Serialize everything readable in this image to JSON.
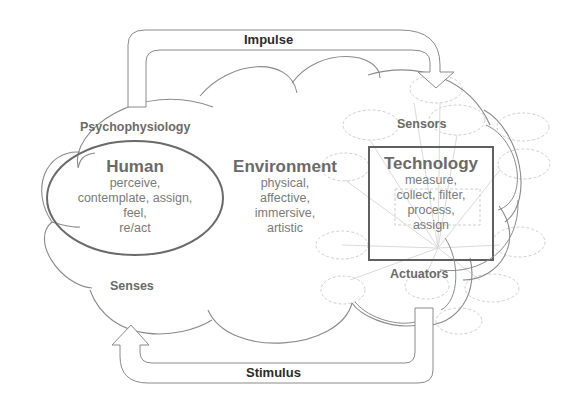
{
  "diagram": {
    "arrows": {
      "impulse": "Impulse",
      "stimulus": "Stimulus"
    },
    "human": {
      "title": "Human",
      "lines": [
        "perceive,",
        "contemplate, assign,",
        "feel,",
        "re/act"
      ],
      "top_label": "Psychophysiology",
      "bottom_label": "Senses"
    },
    "environment": {
      "title": "Environment",
      "lines": [
        "physical,",
        "affective,",
        "immersive,",
        "artistic"
      ]
    },
    "technology": {
      "title": "Technology",
      "lines": [
        "measure,",
        "collect, filter,",
        "process,",
        "assign"
      ],
      "top_label": "Sensors",
      "bottom_label": "Actuators"
    },
    "colors": {
      "line": "#8a8a8a",
      "dark_line": "#5f5f5f",
      "text": "#6e6e6e",
      "arrow_text": "#2b2b2b",
      "network": "#cfcfcf"
    }
  }
}
